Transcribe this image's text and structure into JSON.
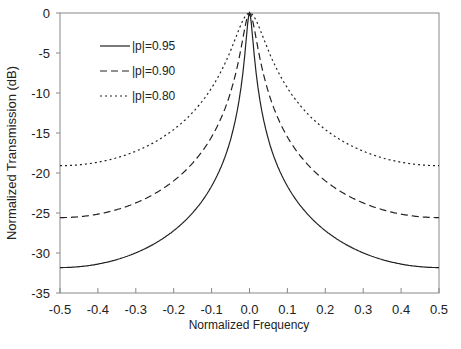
{
  "chart_data": {
    "type": "line",
    "title": "",
    "xlabel": "Normalized Frequency",
    "ylabel": "Normalized Transmission (dB)",
    "xlim": [
      -0.5,
      0.5
    ],
    "ylim": [
      -35,
      0
    ],
    "x_ticks": [
      "-0.5",
      "-0.4",
      "-0.3",
      "-0.2",
      "-0.1",
      "0.0",
      "0.1",
      "0.2",
      "0.3",
      "0.4",
      "0.5"
    ],
    "y_ticks": [
      "0",
      "-5",
      "-10",
      "-15",
      "-20",
      "-25",
      "-30",
      "-35"
    ],
    "grid": false,
    "legend_position": "upper left (inside)",
    "x": [
      -0.5,
      -0.4,
      -0.3,
      -0.2,
      -0.1,
      -0.05,
      0.0,
      0.05,
      0.1,
      0.2,
      0.3,
      0.4,
      0.5
    ],
    "series": [
      {
        "name": "|p|=0.95",
        "style": "solid",
        "values": [
          -31.8,
          -31.2,
          -29.7,
          -26.8,
          -20.5,
          -14.5,
          0,
          -14.5,
          -20.5,
          -26.8,
          -29.7,
          -31.2,
          -31.6
        ]
      },
      {
        "name": "|p|=0.90",
        "style": "dashed",
        "values": [
          -25.6,
          -25.1,
          -23.7,
          -20.8,
          -14.8,
          -9.5,
          0,
          -9.5,
          -14.8,
          -20.8,
          -23.7,
          -25.1,
          -25.3
        ]
      },
      {
        "name": "|p|=0.80",
        "style": "dotted",
        "values": [
          -19.1,
          -18.6,
          -17.2,
          -14.4,
          -9.0,
          -5.0,
          0,
          -5.0,
          -9.0,
          -14.4,
          -17.2,
          -18.6,
          -18.8
        ]
      }
    ]
  },
  "legend": {
    "items": [
      {
        "label": "|p|=0.95"
      },
      {
        "label": "|p|=0.90"
      },
      {
        "label": "|p|=0.80"
      }
    ]
  },
  "axes": {
    "xlabel": "Normalized Frequency",
    "ylabel": "Normalized Transmission (dB)"
  }
}
